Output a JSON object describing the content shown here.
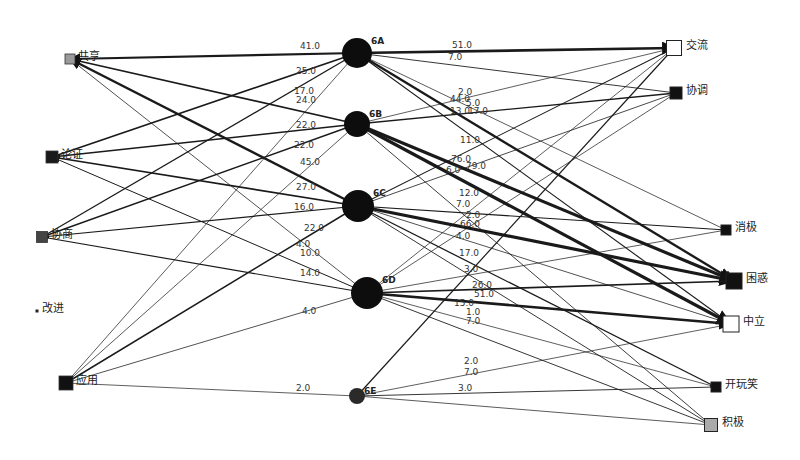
{
  "diagram": {
    "type": "bipartite-directed-network",
    "left_nodes": [
      {
        "id": "share",
        "label": "共享",
        "x": 70,
        "y": 59,
        "size": 10,
        "fill": "#9a9a9a"
      },
      {
        "id": "argue",
        "label": "论证",
        "x": 52,
        "y": 157,
        "size": 12,
        "fill": "#1a1a1a"
      },
      {
        "id": "negotiate",
        "label": "协商",
        "x": 42,
        "y": 237,
        "size": 11,
        "fill": "#444444"
      },
      {
        "id": "improve",
        "label": "改进",
        "x": 37,
        "y": 311,
        "size": 3,
        "fill": "#222222"
      },
      {
        "id": "apply",
        "label": "应用",
        "x": 66,
        "y": 383,
        "size": 14,
        "fill": "#111111"
      }
    ],
    "middle_nodes": [
      {
        "id": "6A",
        "label": "6A",
        "x": 357,
        "y": 53,
        "r": 15
      },
      {
        "id": "6B",
        "label": "6B",
        "x": 357,
        "y": 124,
        "r": 13
      },
      {
        "id": "6C",
        "label": "6C",
        "x": 358,
        "y": 206,
        "r": 16
      },
      {
        "id": "6D",
        "label": "6D",
        "x": 367,
        "y": 293,
        "r": 16
      },
      {
        "id": "6E",
        "label": "6E",
        "x": 357,
        "y": 396,
        "r": 8
      }
    ],
    "right_nodes": [
      {
        "id": "exchange",
        "label": "交流",
        "x": 674,
        "y": 48,
        "size": 15,
        "fill": "#ffffff"
      },
      {
        "id": "coordinate",
        "label": "协调",
        "x": 676,
        "y": 93,
        "size": 12,
        "fill": "#111111"
      },
      {
        "id": "negative",
        "label": "消极",
        "x": 726,
        "y": 230,
        "size": 10,
        "fill": "#111111"
      },
      {
        "id": "confused",
        "label": "困惑",
        "x": 734,
        "y": 281,
        "size": 16,
        "fill": "#111111"
      },
      {
        "id": "neutral",
        "label": "中立",
        "x": 731,
        "y": 324,
        "size": 16,
        "fill": "#ffffff"
      },
      {
        "id": "joke",
        "label": "开玩笑",
        "x": 716,
        "y": 387,
        "size": 10,
        "fill": "#111111"
      },
      {
        "id": "positive",
        "label": "积极",
        "x": 711,
        "y": 425,
        "size": 13,
        "fill": "#aaaaaa"
      }
    ],
    "edges": [
      {
        "from": "6A",
        "to": "share",
        "weight": "41.0",
        "lx": 300,
        "ly": 49
      },
      {
        "from": "6A",
        "to": "argue",
        "weight": "25.0",
        "lx": 296,
        "ly": 74
      },
      {
        "from": "6A",
        "to": "negotiate",
        "weight": "17.0",
        "lx": 294,
        "ly": 94
      },
      {
        "from": "6A",
        "to": "apply",
        "weight": "",
        "lx": 0,
        "ly": 0
      },
      {
        "from": "6B",
        "to": "share",
        "weight": "24.0",
        "lx": 296,
        "ly": 103
      },
      {
        "from": "6B",
        "to": "argue",
        "weight": "22.0",
        "lx": 296,
        "ly": 128
      },
      {
        "from": "6B",
        "to": "negotiate",
        "weight": "22.0",
        "lx": 294,
        "ly": 148
      },
      {
        "from": "6B",
        "to": "apply",
        "weight": "",
        "lx": 0,
        "ly": 0
      },
      {
        "from": "6C",
        "to": "share",
        "weight": "45.0",
        "lx": 300,
        "ly": 165
      },
      {
        "from": "6C",
        "to": "argue",
        "weight": "27.0",
        "lx": 296,
        "ly": 190
      },
      {
        "from": "6C",
        "to": "negotiate",
        "weight": "16.0",
        "lx": 294,
        "ly": 210
      },
      {
        "from": "6C",
        "to": "apply",
        "weight": "22.0",
        "lx": 304,
        "ly": 231
      },
      {
        "from": "6D",
        "to": "share",
        "weight": "4.0",
        "lx": 296,
        "ly": 247
      },
      {
        "from": "6D",
        "to": "argue",
        "weight": "10.0",
        "lx": 300,
        "ly": 256
      },
      {
        "from": "6D",
        "to": "negotiate",
        "weight": "14.0",
        "lx": 300,
        "ly": 276
      },
      {
        "from": "6D",
        "to": "apply",
        "weight": "4.0",
        "lx": 302,
        "ly": 314
      },
      {
        "from": "6E",
        "to": "apply",
        "weight": "2.0",
        "lx": 296,
        "ly": 391
      },
      {
        "from": "6A",
        "to": "exchange",
        "weight": "51.0",
        "lx": 452,
        "ly": 48
      },
      {
        "from": "6A",
        "to": "coordinate",
        "weight": "7.0",
        "lx": 448,
        "ly": 60
      },
      {
        "from": "6A",
        "to": "confused",
        "weight": "44.0",
        "lx": 450,
        "ly": 102
      },
      {
        "from": "6A",
        "to": "neutral",
        "weight": "13.0",
        "lx": 450,
        "ly": 114
      },
      {
        "from": "6A",
        "to": "negative",
        "weight": "",
        "lx": 0,
        "ly": 0
      },
      {
        "from": "6B",
        "to": "exchange",
        "weight": "2.0",
        "lx": 458,
        "ly": 95
      },
      {
        "from": "6B",
        "to": "coordinate",
        "weight": "17.0",
        "lx": 468,
        "ly": 114
      },
      {
        "from": "6B",
        "to": "confused",
        "weight": "76.0",
        "lx": 451,
        "ly": 162
      },
      {
        "from": "6B",
        "to": "neutral",
        "weight": "79.0",
        "lx": 466,
        "ly": 169
      },
      {
        "from": "6B",
        "to": "positive",
        "weight": "6.0",
        "lx": 446,
        "ly": 173
      },
      {
        "from": "6C",
        "to": "exchange",
        "weight": "11.0",
        "lx": 460,
        "ly": 143
      },
      {
        "from": "6C",
        "to": "coordinate",
        "weight": "5.0",
        "lx": 466,
        "ly": 106
      },
      {
        "from": "6C",
        "to": "negative",
        "weight": "12.0",
        "lx": 459,
        "ly": 196
      },
      {
        "from": "6C",
        "to": "confused",
        "weight": "66.0",
        "lx": 460,
        "ly": 227
      },
      {
        "from": "6C",
        "to": "neutral",
        "weight": "4.0",
        "lx": 456,
        "ly": 239
      },
      {
        "from": "6C",
        "to": "joke",
        "weight": "17.0",
        "lx": 459,
        "ly": 256
      },
      {
        "from": "6C",
        "to": "positive",
        "weight": "7.0",
        "lx": 456,
        "ly": 207
      },
      {
        "from": "6D",
        "to": "exchange",
        "weight": "2.0",
        "lx": 466,
        "ly": 218
      },
      {
        "from": "6D",
        "to": "coordinate",
        "weight": "",
        "lx": 0,
        "ly": 0
      },
      {
        "from": "6D",
        "to": "negative",
        "weight": "3.0",
        "lx": 464,
        "ly": 272
      },
      {
        "from": "6D",
        "to": "confused",
        "weight": "26.0",
        "lx": 472,
        "ly": 288
      },
      {
        "from": "6D",
        "to": "neutral",
        "weight": "51.0",
        "lx": 474,
        "ly": 297
      },
      {
        "from": "6D",
        "to": "joke",
        "weight": "1.0",
        "lx": 466,
        "ly": 315
      },
      {
        "from": "6D",
        "to": "positive",
        "weight": "7.0",
        "lx": 466,
        "ly": 324
      },
      {
        "from": "6E",
        "to": "exchange",
        "weight": "15.0",
        "lx": 454,
        "ly": 306
      },
      {
        "from": "6E",
        "to": "neutral",
        "weight": "2.0",
        "lx": 464,
        "ly": 364
      },
      {
        "from": "6E",
        "to": "joke",
        "weight": "7.0",
        "lx": 464,
        "ly": 375
      },
      {
        "from": "6E",
        "to": "positive",
        "weight": "3.0",
        "lx": 458,
        "ly": 391
      }
    ]
  }
}
